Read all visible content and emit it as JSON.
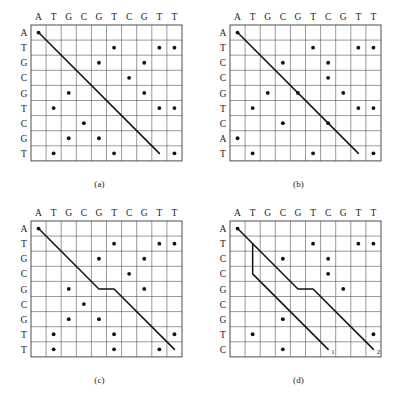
{
  "figure": {
    "title": "",
    "panels": [
      {
        "id": "a",
        "caption": "(a)",
        "columns": [
          "A",
          "T",
          "G",
          "C",
          "G",
          "T",
          "C",
          "G",
          "T",
          "T"
        ],
        "rows": [
          "A",
          "T",
          "G",
          "C",
          "G",
          "T",
          "C",
          "G",
          "T"
        ],
        "dots": [
          [
            0,
            0
          ],
          [
            5,
            1
          ],
          [
            8,
            1
          ],
          [
            9,
            1
          ],
          [
            4,
            2
          ],
          [
            7,
            2
          ],
          [
            6,
            3
          ],
          [
            2,
            4
          ],
          [
            7,
            4
          ],
          [
            1,
            5
          ],
          [
            8,
            5
          ],
          [
            9,
            5
          ],
          [
            3,
            6
          ],
          [
            2,
            7
          ],
          [
            4,
            7
          ],
          [
            1,
            8
          ],
          [
            5,
            8
          ],
          [
            9,
            8
          ]
        ],
        "paths": [
          {
            "name": "main-diagonal",
            "points": [
              [
                0,
                0
              ],
              [
                8,
                8
              ]
            ],
            "end_label": ""
          }
        ]
      },
      {
        "id": "b",
        "caption": "(b)",
        "columns": [
          "A",
          "T",
          "G",
          "C",
          "G",
          "T",
          "C",
          "G",
          "T",
          "T"
        ],
        "rows": [
          "A",
          "T",
          "C",
          "C",
          "G",
          "T",
          "C",
          "A",
          "T"
        ],
        "dots": [
          [
            0,
            0
          ],
          [
            5,
            1
          ],
          [
            8,
            1
          ],
          [
            9,
            1
          ],
          [
            3,
            2
          ],
          [
            6,
            2
          ],
          [
            6,
            3
          ],
          [
            2,
            4
          ],
          [
            4,
            4
          ],
          [
            7,
            4
          ],
          [
            1,
            5
          ],
          [
            8,
            5
          ],
          [
            9,
            5
          ],
          [
            3,
            6
          ],
          [
            6,
            6
          ],
          [
            0,
            7
          ],
          [
            1,
            8
          ],
          [
            5,
            8
          ],
          [
            9,
            8
          ]
        ],
        "paths": [
          {
            "name": "main-diagonal",
            "points": [
              [
                0,
                0
              ],
              [
                8,
                8
              ]
            ],
            "end_label": ""
          }
        ]
      },
      {
        "id": "c",
        "caption": "(c)",
        "columns": [
          "A",
          "T",
          "G",
          "C",
          "G",
          "T",
          "C",
          "G",
          "T",
          "T"
        ],
        "rows": [
          "A",
          "T",
          "G",
          "C",
          "G",
          "C",
          "G",
          "T",
          "T"
        ],
        "dots": [
          [
            0,
            0
          ],
          [
            5,
            1
          ],
          [
            8,
            1
          ],
          [
            9,
            1
          ],
          [
            4,
            2
          ],
          [
            7,
            2
          ],
          [
            6,
            3
          ],
          [
            2,
            4
          ],
          [
            7,
            4
          ],
          [
            3,
            5
          ],
          [
            2,
            6
          ],
          [
            4,
            6
          ],
          [
            1,
            7
          ],
          [
            5,
            7
          ],
          [
            9,
            7
          ],
          [
            1,
            8
          ],
          [
            5,
            8
          ],
          [
            8,
            8
          ]
        ],
        "paths": [
          {
            "name": "gapped-path",
            "points": [
              [
                0,
                0
              ],
              [
                4,
                4
              ],
              [
                5,
                4
              ],
              [
                9,
                8
              ]
            ],
            "end_label": ""
          }
        ]
      },
      {
        "id": "d",
        "caption": "(d)",
        "columns": [
          "A",
          "T",
          "G",
          "C",
          "G",
          "T",
          "C",
          "G",
          "T",
          "T"
        ],
        "rows": [
          "A",
          "T",
          "C",
          "C",
          "G",
          "C",
          "G",
          "T",
          "C"
        ],
        "dots": [
          [
            0,
            0
          ],
          [
            5,
            1
          ],
          [
            8,
            1
          ],
          [
            9,
            1
          ],
          [
            3,
            2
          ],
          [
            6,
            2
          ],
          [
            6,
            3
          ],
          [
            7,
            4
          ],
          [
            3,
            6
          ],
          [
            1,
            7
          ],
          [
            9,
            7
          ],
          [
            3,
            8
          ]
        ],
        "paths": [
          {
            "name": "path-1",
            "points": [
              [
                1,
                1
              ],
              [
                1,
                3
              ],
              [
                6,
                8
              ]
            ],
            "end_label": "1"
          },
          {
            "name": "path-2",
            "points": [
              [
                0,
                0
              ],
              [
                4,
                4
              ],
              [
                5,
                4
              ],
              [
                9,
                8
              ]
            ],
            "end_label": "2"
          }
        ]
      }
    ]
  }
}
